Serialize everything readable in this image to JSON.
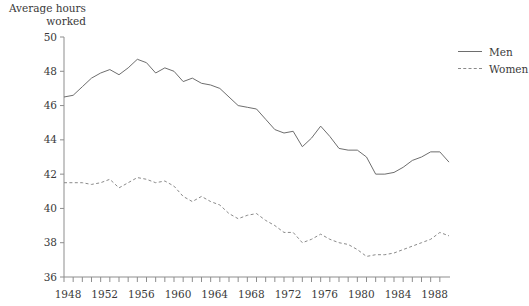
{
  "chart_data": {
    "type": "line",
    "title": "Average hours\nworked",
    "xlabel": "",
    "ylabel": "Average hours worked",
    "ylim": [
      36,
      50
    ],
    "xlim": [
      1948,
      1990
    ],
    "ytick_step": 2,
    "yticks": [
      36,
      38,
      40,
      42,
      44,
      46,
      48,
      50
    ],
    "xticks": [
      1948,
      1949,
      1950,
      1951,
      1952,
      1953,
      1954,
      1955,
      1956,
      1957,
      1958,
      1959,
      1960,
      1961,
      1962,
      1963,
      1964,
      1965,
      1966,
      1967,
      1968,
      1969,
      1970,
      1971,
      1972,
      1973,
      1974,
      1975,
      1976,
      1977,
      1978,
      1979,
      1980,
      1981,
      1982,
      1983,
      1984,
      1985,
      1986,
      1987,
      1988,
      1989
    ],
    "xtick_labels": [
      1948,
      1952,
      1956,
      1960,
      1964,
      1968,
      1972,
      1976,
      1980,
      1984,
      1988
    ],
    "grid": false,
    "legend_position": "right",
    "x": [
      1948,
      1949,
      1950,
      1951,
      1952,
      1953,
      1954,
      1955,
      1956,
      1957,
      1958,
      1959,
      1960,
      1961,
      1962,
      1963,
      1964,
      1965,
      1966,
      1967,
      1968,
      1969,
      1970,
      1971,
      1972,
      1973,
      1974,
      1975,
      1976,
      1977,
      1978,
      1979,
      1980,
      1981,
      1982,
      1983,
      1984,
      1985,
      1986,
      1987,
      1988,
      1989,
      1990
    ],
    "series": [
      {
        "name": "Men",
        "style": "solid",
        "color": "#6e6e6e",
        "values": [
          46.5,
          46.6,
          47.1,
          47.6,
          47.9,
          48.1,
          47.8,
          48.2,
          48.7,
          48.5,
          47.9,
          48.2,
          48.0,
          47.4,
          47.6,
          47.3,
          47.2,
          47.0,
          46.5,
          46.0,
          45.9,
          45.8,
          45.2,
          44.6,
          44.4,
          44.5,
          43.6,
          44.1,
          44.8,
          44.2,
          43.5,
          43.4,
          43.4,
          43.0,
          42.0,
          42.0,
          42.1,
          42.4,
          42.8,
          43.0,
          43.3,
          43.3,
          42.7
        ]
      },
      {
        "name": "Women",
        "style": "dashed",
        "color": "#8a8a8a",
        "values": [
          41.5,
          41.5,
          41.5,
          41.4,
          41.5,
          41.7,
          41.2,
          41.5,
          41.8,
          41.7,
          41.5,
          41.6,
          41.3,
          40.7,
          40.4,
          40.7,
          40.4,
          40.2,
          39.7,
          39.4,
          39.6,
          39.7,
          39.3,
          39.0,
          38.6,
          38.6,
          38.0,
          38.2,
          38.5,
          38.2,
          38.0,
          37.9,
          37.6,
          37.2,
          37.3,
          37.3,
          37.4,
          37.6,
          37.8,
          38.0,
          38.2,
          38.6,
          38.4
        ]
      }
    ]
  },
  "legend": {
    "items": [
      {
        "label": "Men",
        "style": "solid"
      },
      {
        "label": "Women",
        "style": "dashed"
      }
    ]
  }
}
